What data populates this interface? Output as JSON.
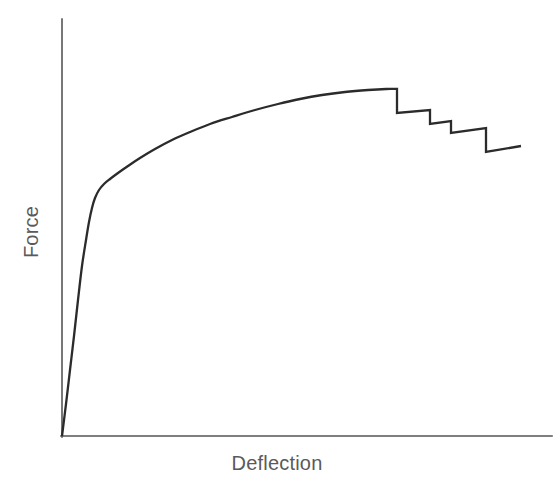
{
  "chart_data": {
    "type": "line",
    "title": "",
    "subtitle": "",
    "xlabel": "Deflection",
    "ylabel": "Force",
    "xlim": [
      0,
      1
    ],
    "ylim": [
      0,
      1
    ],
    "grid": false,
    "legend": null,
    "annotations": [],
    "axis_ticks": {
      "x": [],
      "y": []
    },
    "series": [
      {
        "name": "Force-Deflection response",
        "description": "Load-deflection curve: steep linear elastic rise, yielding knee, gradual strain-hardening plateau to peak load, then progressive saw-tooth load drops as the specimen fails.",
        "color": "#2b2b2b",
        "line_width": 2.3,
        "points_pixel": [
          [
            62,
            436
          ],
          [
            66,
            404
          ],
          [
            70,
            370
          ],
          [
            74,
            336
          ],
          [
            78,
            300
          ],
          [
            82,
            266
          ],
          [
            86,
            240
          ],
          [
            89,
            222
          ],
          [
            92,
            208
          ],
          [
            95,
            198
          ],
          [
            99,
            190
          ],
          [
            104,
            184
          ],
          [
            110,
            179
          ],
          [
            118,
            173
          ],
          [
            128,
            166
          ],
          [
            140,
            158
          ],
          [
            155,
            149
          ],
          [
            172,
            140
          ],
          [
            190,
            132
          ],
          [
            210,
            124
          ],
          [
            232,
            117
          ],
          [
            255,
            110
          ],
          [
            278,
            104
          ],
          [
            300,
            99
          ],
          [
            322,
            95
          ],
          [
            345,
            92
          ],
          [
            368,
            90
          ],
          [
            386,
            89
          ],
          [
            397,
            89
          ],
          [
            397,
            113
          ],
          [
            430,
            110
          ],
          [
            430,
            124
          ],
          [
            451,
            121
          ],
          [
            451,
            133
          ],
          [
            486,
            128
          ],
          [
            486,
            152
          ],
          [
            521,
            146
          ]
        ],
        "normalized_points": [
          [
            0.0,
            0.0
          ],
          [
            0.008,
            0.077
          ],
          [
            0.016,
            0.159
          ],
          [
            0.024,
            0.24
          ],
          [
            0.033,
            0.327
          ],
          [
            0.041,
            0.409
          ],
          [
            0.049,
            0.471
          ],
          [
            0.055,
            0.514
          ],
          [
            0.061,
            0.548
          ],
          [
            0.067,
            0.572
          ],
          [
            0.075,
            0.591
          ],
          [
            0.085,
            0.606
          ],
          [
            0.098,
            0.618
          ],
          [
            0.114,
            0.632
          ],
          [
            0.134,
            0.649
          ],
          [
            0.159,
            0.668
          ],
          [
            0.189,
            0.69
          ],
          [
            0.224,
            0.712
          ],
          [
            0.261,
            0.731
          ],
          [
            0.302,
            0.75
          ],
          [
            0.347,
            0.767
          ],
          [
            0.394,
            0.784
          ],
          [
            0.441,
            0.798
          ],
          [
            0.486,
            0.81
          ],
          [
            0.531,
            0.82
          ],
          [
            0.578,
            0.827
          ],
          [
            0.625,
            0.832
          ],
          [
            0.662,
            0.834
          ],
          [
            0.684,
            0.834
          ],
          [
            0.684,
            0.777
          ],
          [
            0.752,
            0.784
          ],
          [
            0.752,
            0.75
          ],
          [
            0.795,
            0.758
          ],
          [
            0.795,
            0.729
          ],
          [
            0.867,
            0.741
          ],
          [
            0.867,
            0.683
          ],
          [
            0.938,
            0.697
          ]
        ],
        "peak_load_normalized": 0.834,
        "load_drops": [
          {
            "at_x": 0.684,
            "from_y": 0.834,
            "to_y": 0.777
          },
          {
            "at_x": 0.752,
            "from_y": 0.784,
            "to_y": 0.75
          },
          {
            "at_x": 0.795,
            "from_y": 0.758,
            "to_y": 0.729
          },
          {
            "at_x": 0.867,
            "from_y": 0.741,
            "to_y": 0.683
          }
        ]
      }
    ]
  },
  "figure": {
    "background_color": "#ffffff",
    "axis_color": "#555555",
    "curve_color": "#2b2b2b",
    "label_color": "#5a5a5a",
    "axes": {
      "y_axis_pixel": {
        "x": 62,
        "y_top": 19,
        "y_bottom": 437
      },
      "x_axis_pixel": {
        "y": 436,
        "x_left": 61,
        "x_right": 552
      }
    }
  }
}
